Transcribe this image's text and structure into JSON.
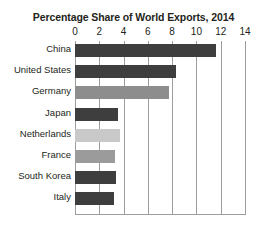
{
  "chart_data": {
    "type": "bar",
    "orientation": "horizontal",
    "title": "Percentage Share of World Exports, 2014",
    "xlabel": "",
    "ylabel": "",
    "xlim": [
      0,
      14
    ],
    "xticks": [
      0,
      2,
      4,
      6,
      8,
      10,
      12,
      14
    ],
    "xtick_labels": [
      "0",
      "2",
      "4",
      "6",
      "8",
      "10",
      "12",
      "14"
    ],
    "grid": true,
    "grid_axis": "x",
    "legend": false,
    "categories": [
      "China",
      "United States",
      "Germany",
      "Japan",
      "Netherlands",
      "France",
      "South Korea",
      "Italy"
    ],
    "values": [
      11.6,
      8.3,
      7.7,
      3.5,
      3.7,
      3.3,
      3.4,
      3.2
    ],
    "bar_colors": [
      "#3e3e3e",
      "#3e3e3e",
      "#8d8d8d",
      "#3e3e3e",
      "#c9c9c9",
      "#9b9b9b",
      "#3e3e3e",
      "#3e3e3e"
    ],
    "bars": [
      {
        "label": "China",
        "value": 11.6,
        "color": "#3e3e3e"
      },
      {
        "label": "United States",
        "value": 8.3,
        "color": "#3e3e3e"
      },
      {
        "label": "Germany",
        "value": 7.7,
        "color": "#8d8d8d"
      },
      {
        "label": "Japan",
        "value": 3.5,
        "color": "#3e3e3e"
      },
      {
        "label": "Netherlands",
        "value": 3.7,
        "color": "#c9c9c9"
      },
      {
        "label": "France",
        "value": 3.3,
        "color": "#9b9b9b"
      },
      {
        "label": "South Korea",
        "value": 3.4,
        "color": "#3e3e3e"
      },
      {
        "label": "Italy",
        "value": 3.2,
        "color": "#3e3e3e"
      }
    ]
  },
  "colors": {
    "gridline": "#9d9d9d",
    "text": "#231f20",
    "background": "#ffffff"
  }
}
